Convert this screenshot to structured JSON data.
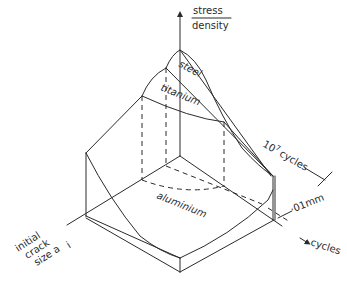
{
  "diagram": {
    "type": "3d-surface-sketch",
    "axes": {
      "vertical": {
        "label_numerator": "stress",
        "label_denominator": "density"
      },
      "right": {
        "label": "cycles"
      },
      "left": {
        "label_lines": [
          "initial",
          "crack",
          "size a"
        ],
        "subscript": "i"
      }
    },
    "surfaces": [
      {
        "label": "steel"
      },
      {
        "label": "titanium"
      },
      {
        "label": "aluminium"
      }
    ],
    "annotations": {
      "cycles_limit": {
        "base": "10",
        "exponent": "7",
        "suffix": "cycles"
      },
      "crack_size": "·01mm"
    }
  }
}
